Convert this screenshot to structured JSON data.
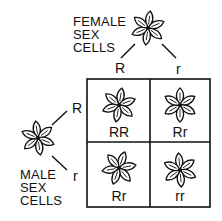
{
  "female": {
    "label_lines": [
      "FEMALE",
      "SEX",
      "CELLS"
    ],
    "alleles": [
      "R",
      "r"
    ]
  },
  "male": {
    "label_lines": [
      "MALE",
      "SEX",
      "CELLS"
    ],
    "alleles": [
      "R",
      "r"
    ]
  },
  "punnett": {
    "cells": [
      {
        "genotype": "RR"
      },
      {
        "genotype": "Rr"
      },
      {
        "genotype": "Rr"
      },
      {
        "genotype": "rr"
      }
    ]
  },
  "icons": {
    "flower": "flower-icon"
  }
}
